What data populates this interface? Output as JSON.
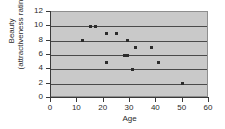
{
  "chart_data": {
    "type": "scatter",
    "title": "",
    "xlabel": "Age",
    "ylabel_lines": [
      "Beauty",
      "(attractiveness rating)"
    ],
    "ylabel": "Beauty (attractiveness rating)",
    "xlim": [
      0,
      60
    ],
    "ylim": [
      0,
      12
    ],
    "xticks": [
      0,
      10,
      20,
      30,
      40,
      50,
      60
    ],
    "yticks": [
      0,
      2,
      4,
      6,
      8,
      10,
      12
    ],
    "xtick_labels": [
      "0",
      "10",
      "20",
      "30",
      "40",
      "50",
      "60"
    ],
    "ytick_labels": [
      "0",
      "2",
      "4",
      "6",
      "8",
      "10",
      "12"
    ],
    "grid": "horizontal",
    "legend": "none",
    "plot_background": "#c9c9c9",
    "point_color": "#2b2b2b",
    "gridline_color": "#4a4a4a",
    "axis_color": "#3a3a3a",
    "points": [
      {
        "x": 12,
        "y": 8
      },
      {
        "x": 15,
        "y": 10
      },
      {
        "x": 17,
        "y": 10
      },
      {
        "x": 21,
        "y": 9
      },
      {
        "x": 21,
        "y": 5
      },
      {
        "x": 25,
        "y": 9
      },
      {
        "x": 28,
        "y": 6
      },
      {
        "x": 29,
        "y": 8
      },
      {
        "x": 29,
        "y": 6
      },
      {
        "x": 31,
        "y": 4
      },
      {
        "x": 32,
        "y": 7
      },
      {
        "x": 38,
        "y": 7
      },
      {
        "x": 41,
        "y": 5
      },
      {
        "x": 50,
        "y": 2
      }
    ],
    "x": [
      12,
      15,
      17,
      21,
      21,
      25,
      28,
      29,
      29,
      31,
      32,
      38,
      41,
      50
    ],
    "values": [
      8,
      10,
      10,
      9,
      5,
      9,
      6,
      8,
      6,
      4,
      7,
      7,
      5,
      2
    ]
  }
}
